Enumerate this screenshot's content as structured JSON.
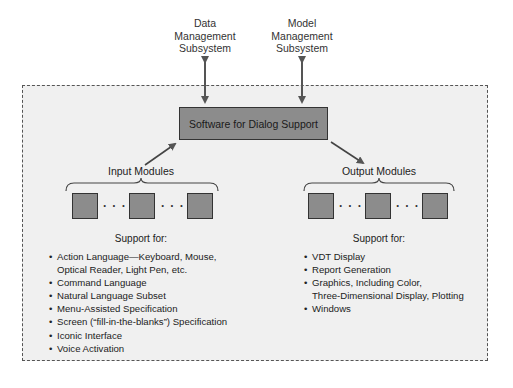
{
  "external_subsystems": [
    {
      "id": "data",
      "lines": [
        "Data",
        "Management",
        "Subsystem"
      ]
    },
    {
      "id": "model",
      "lines": [
        "Model",
        "Management",
        "Subsystem"
      ]
    }
  ],
  "central": {
    "label": "Software for Dialog Support"
  },
  "input": {
    "title": "Input Modules",
    "dots": "· · ·",
    "support_title": "Support for:",
    "bullet": "•",
    "items": [
      {
        "lines": [
          "Action Language—Keyboard, Mouse,",
          "Optical Reader, Light Pen, etc."
        ]
      },
      {
        "lines": [
          "Command Language"
        ]
      },
      {
        "lines": [
          "Natural Language Subset"
        ]
      },
      {
        "lines": [
          "Menu-Assisted Specification"
        ]
      },
      {
        "lines": [
          "Screen (“fill-in-the-blanks”) Specification"
        ]
      },
      {
        "lines": [
          "Iconic Interface"
        ]
      },
      {
        "lines": [
          "Voice Activation"
        ]
      }
    ]
  },
  "output": {
    "title": "Output Modules",
    "dots": "· · ·",
    "support_title": "Support for:",
    "bullet": "•",
    "items": [
      {
        "lines": [
          "VDT Display"
        ]
      },
      {
        "lines": [
          "Report Generation"
        ]
      },
      {
        "lines": [
          "Graphics, Including Color,",
          "Three-Dimensional Display, Plotting"
        ]
      },
      {
        "lines": [
          "Windows"
        ]
      }
    ]
  },
  "colors": {
    "container_bg": "#f0f0f0",
    "box_fill": "#8c8c8c",
    "box_border": "#333333",
    "arrow": "#555555"
  }
}
